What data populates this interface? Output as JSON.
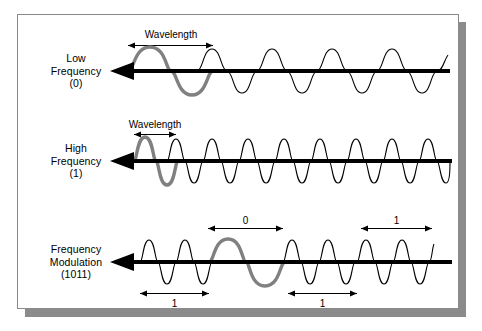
{
  "figure": {
    "title_visible": false,
    "background_color": "#ffffff",
    "frame_border_color": "#8a8a8a",
    "shadow_color": "#8b8b8b",
    "wave_thin_color": "#000000",
    "wave_highlight_color": "#808080",
    "axis_color": "#000000"
  },
  "rows": [
    {
      "id": "low-frequency",
      "label_lines": [
        "Low",
        "Frequency",
        "(0)"
      ],
      "measure": {
        "text": "Wavelength",
        "x_start": 128,
        "x_end": 213
      },
      "wave": {
        "cycles": 4.6,
        "amplitude": 22,
        "highlight_cycles": 1,
        "x_start": 128,
        "x_end": 448,
        "baseline_y": 71
      }
    },
    {
      "id": "high-frequency",
      "label_lines": [
        "High",
        "Frequency",
        "(1)"
      ],
      "measure": {
        "text": "Wavelength",
        "x_start": 134,
        "x_end": 176
      },
      "wave": {
        "cycles": 9.2,
        "amplitude": 22,
        "highlight_cycles": 1,
        "x_start": 134,
        "x_end": 450,
        "baseline_y": 161
      }
    },
    {
      "id": "frequency-modulation",
      "label_lines": [
        "Frequency",
        "Modulation",
        "(1011)"
      ],
      "wave": {
        "amplitude": 22,
        "baseline_y": 262,
        "segments": [
          {
            "bit": "1",
            "x_start": 140,
            "x_end": 209,
            "cycles": 2,
            "highlight": false
          },
          {
            "bit": "0",
            "x_start": 209,
            "x_end": 283,
            "cycles": 1,
            "highlight": true
          },
          {
            "bit": "1",
            "x_start": 283,
            "x_end": 357,
            "cycles": 2,
            "highlight": false
          },
          {
            "bit": "1",
            "x_start": 357,
            "x_end": 432,
            "cycles": 2,
            "highlight": false
          }
        ]
      },
      "markers_above": [
        {
          "text": "0",
          "x_start": 208,
          "x_end": 283,
          "y": 228
        },
        {
          "text": "1",
          "x_start": 361,
          "x_end": 432,
          "y": 228
        }
      ],
      "markers_below": [
        {
          "text": "1",
          "x_start": 140,
          "x_end": 209,
          "y": 293
        },
        {
          "text": "1",
          "x_start": 288,
          "x_end": 357,
          "y": 293
        }
      ]
    }
  ],
  "axis_arrows": [
    {
      "row": "low-frequency",
      "direction": "left",
      "y": 71,
      "x_tip": 112,
      "x_tail": 450
    },
    {
      "row": "high-frequency",
      "direction": "left",
      "y": 161,
      "x_tip": 112,
      "x_tail": 452
    },
    {
      "row": "frequency-modulation",
      "direction": "left",
      "y": 262,
      "x_tip": 112,
      "x_tail": 452
    }
  ]
}
